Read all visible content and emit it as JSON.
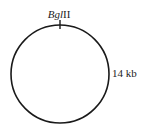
{
  "diagram": {
    "type": "plasmid-map",
    "site": {
      "enzyme_italic": "Bgl",
      "enzyme_roman": "II"
    },
    "size_label": "14 kb",
    "colors": {
      "line": "#1a1a1a",
      "text": "#222222",
      "background": "#ffffff"
    }
  }
}
